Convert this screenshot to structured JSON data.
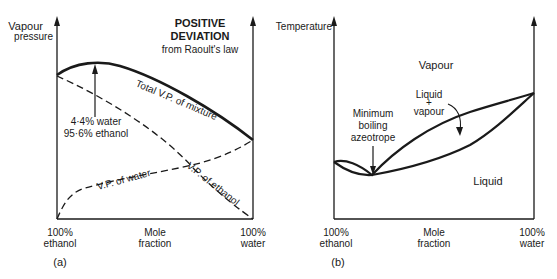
{
  "diagram_a": {
    "panel_label": "(a)",
    "y_axis_label_line1": "Vapour",
    "y_axis_label_line2": "pressure",
    "title_line1": "POSITIVE",
    "title_line2": "DEVIATION",
    "title_line3": "from Raoult's law",
    "x_left_line1": "100%",
    "x_left_line2": "ethanol",
    "x_mid_line1": "Mole",
    "x_mid_line2": "fraction",
    "x_right_line1": "100%",
    "x_right_line2": "water",
    "curve_total": "Total V.P. of mixture",
    "curve_water": "V.P. of water",
    "curve_ethanol": "V.P. of ethanol",
    "annotation_line1": "4·4% water",
    "annotation_line2": "95·6% ethanol"
  },
  "diagram_b": {
    "panel_label": "(b)",
    "y_axis_label": "Temperature",
    "region_vapour": "Vapour",
    "region_liquid": "Liquid",
    "region_mix_line1": "Liquid",
    "region_mix_line2": "+",
    "region_mix_line3": "vapour",
    "annotation_line1": "Minimum",
    "annotation_line2": "boiling",
    "annotation_line3": "azeotrope",
    "x_left_line1": "100%",
    "x_left_line2": "ethanol",
    "x_mid_line1": "Mole",
    "x_mid_line2": "fraction",
    "x_right_line1": "100%",
    "x_right_line2": "water"
  }
}
